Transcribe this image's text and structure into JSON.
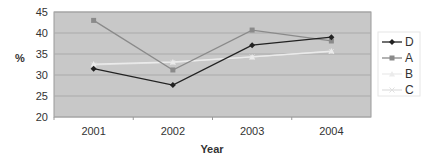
{
  "chart_data": {
    "type": "line",
    "title": "",
    "xlabel": "Year",
    "ylabel": "%",
    "categories": [
      "2001",
      "2002",
      "2003",
      "2004"
    ],
    "ylim": [
      20,
      45
    ],
    "yticks": [
      20,
      25,
      30,
      35,
      40,
      45
    ],
    "grid": true,
    "legend_position": "right",
    "series": [
      {
        "name": "D",
        "values": [
          31.5,
          27.6,
          37.1,
          39.0
        ],
        "color": "#222222",
        "marker": "diamond"
      },
      {
        "name": "A",
        "values": [
          43.0,
          31.2,
          40.7,
          38.1
        ],
        "color": "#8a8a8a",
        "marker": "square"
      },
      {
        "name": "B",
        "values": [
          32.6,
          33.1,
          34.3,
          35.7
        ],
        "color": "#ebebeb",
        "marker": "triangle"
      },
      {
        "name": "C",
        "values": [
          32.4,
          33.0,
          34.3,
          35.6
        ],
        "color": "#e0e0e0",
        "marker": "x"
      }
    ]
  },
  "colors": {
    "plot_background": "#c8c8c8",
    "gridline": "#aaaaaa",
    "text": "#333333"
  }
}
